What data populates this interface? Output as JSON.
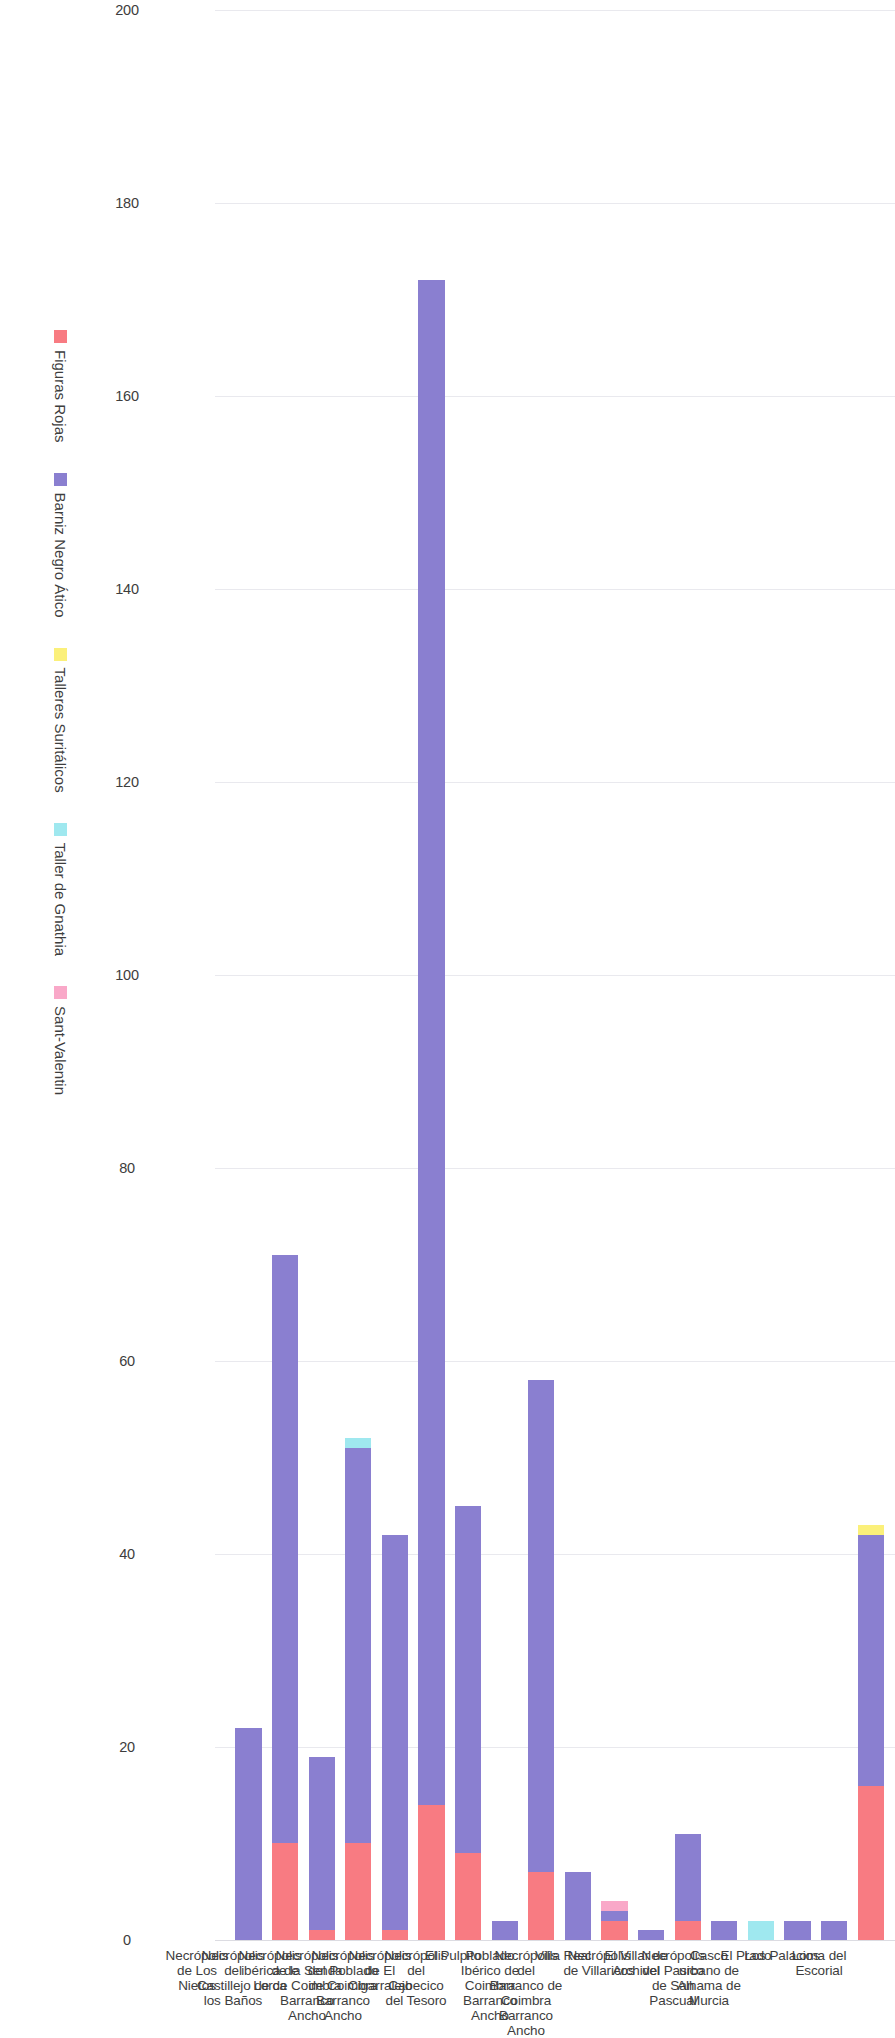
{
  "chart_data": {
    "type": "bar",
    "orientation": "horizontal",
    "title": "",
    "xlabel": "",
    "ylabel": "",
    "xlim": [
      0,
      200
    ],
    "ticks": [
      0,
      20,
      40,
      60,
      80,
      100,
      120,
      140,
      160,
      180,
      200
    ],
    "tick_labels": [
      "0",
      "20",
      "40",
      "60",
      "80",
      "100",
      "120",
      "140",
      "160",
      "180",
      "200"
    ],
    "grid": true,
    "legend_position": "bottom",
    "categories": [
      "Loma del Escorial",
      "Los Palacios",
      "El Prado",
      "Casco urbano de Alhama de Murcia",
      "Necrópolis del Pasico de San Pascual",
      "El Villar de Archivel",
      "Necrópolis de Villaricos",
      "Villa Real",
      "Necrópolis del Barranco de Coimbra Barranco Ancho",
      "Poblado Ibérico de Coimbra Barranco Ancho",
      "El Pulpito",
      "Necrópolis del Cabecico del Tesoro",
      "Necrópolis de El Cigarralejo",
      "Necrópolis del Poblado de Coimbra Barranco Ancho",
      "Necrópolis de la Senda de Coimbra Barranco Ancho",
      "Necrópolis ibérica de Lorca",
      "Necrópolis del Castillejo de los Baños",
      "Necrópolis de Los Nietos"
    ],
    "category_lines": [
      [
        "Loma del",
        "Escorial"
      ],
      [
        "Los Palacios"
      ],
      [
        "El Prado"
      ],
      [
        "Casco",
        "urbano de",
        "Alhama de",
        "Murcia"
      ],
      [
        "Necrópolis",
        "del Pasico",
        "de San",
        "Pascual"
      ],
      [
        "El Villar de",
        "Archivel"
      ],
      [
        "Necrópolis",
        "de Villaricos"
      ],
      [
        "Villa Real"
      ],
      [
        "Necrópolis",
        "del",
        "Barranco de",
        "Coimbra",
        "Barranco",
        "Ancho"
      ],
      [
        "Poblado",
        "Ibérico de",
        "Coimbra",
        "Barranco",
        "Ancho"
      ],
      [
        "El Pulpito"
      ],
      [
        "Necrópolis",
        "del",
        "Cabecico",
        "del Tesoro"
      ],
      [
        "Necrópolis",
        "de El",
        "Cigarralejo"
      ],
      [
        "Necrópolis",
        "del Poblado",
        "de Coimbra",
        "Barranco",
        "Ancho"
      ],
      [
        "Necrópolis",
        "de la Senda",
        "de Coimbra",
        "Barranco",
        "Ancho"
      ],
      [
        "Necrópolis",
        "ibérica de",
        "Lorca"
      ],
      [
        "Necrópolis",
        "del",
        "Castillejo de",
        "los Baños"
      ],
      [
        "Necrópolis",
        "de Los",
        "Nietos"
      ]
    ],
    "series": [
      {
        "name": "Figuras Rojas",
        "color": "#f87b82",
        "values": [
          16,
          0,
          0,
          0,
          0,
          2,
          0,
          2,
          0,
          7,
          0,
          9,
          14,
          1,
          10,
          1,
          10,
          0
        ]
      },
      {
        "name": "Barniz Negro Ático",
        "color": "#8a7fd0",
        "values": [
          26,
          2,
          2,
          0,
          2,
          9,
          1,
          1,
          7,
          51,
          2,
          36,
          158,
          41,
          41,
          18,
          61,
          22
        ]
      },
      {
        "name": "Talleres Suritálicos",
        "color": "#fbf07a",
        "values": [
          1,
          0,
          0,
          0,
          0,
          0,
          0,
          0,
          0,
          0,
          0,
          0,
          0,
          0,
          0,
          0,
          0,
          0
        ]
      },
      {
        "name": "Taller de Gnathia",
        "color": "#9fe8ef",
        "values": [
          0,
          0,
          0,
          2,
          0,
          0,
          0,
          0,
          0,
          0,
          0,
          0,
          0,
          0,
          1,
          0,
          0,
          0
        ]
      },
      {
        "name": "Sant-Valentin",
        "color": "#f9a8c8",
        "values": [
          0,
          0,
          0,
          0,
          0,
          0,
          0,
          1,
          0,
          0,
          0,
          0,
          0,
          0,
          0,
          0,
          0,
          0
        ]
      }
    ],
    "totals": [
      43,
      2,
      2,
      2,
      2,
      11,
      1,
      4,
      7,
      58,
      2,
      45,
      172,
      42,
      52,
      19,
      71,
      22
    ]
  },
  "legend": {
    "items": [
      {
        "label": "Figuras Rojas",
        "color": "#f87b82"
      },
      {
        "label": "Barniz Negro Ático",
        "color": "#8a7fd0"
      },
      {
        "label": "Talleres Suritálicos",
        "color": "#fbf07a"
      },
      {
        "label": "Taller de Gnathia",
        "color": "#9fe8ef"
      },
      {
        "label": "Sant-Valentin",
        "color": "#f9a8c8"
      }
    ]
  }
}
